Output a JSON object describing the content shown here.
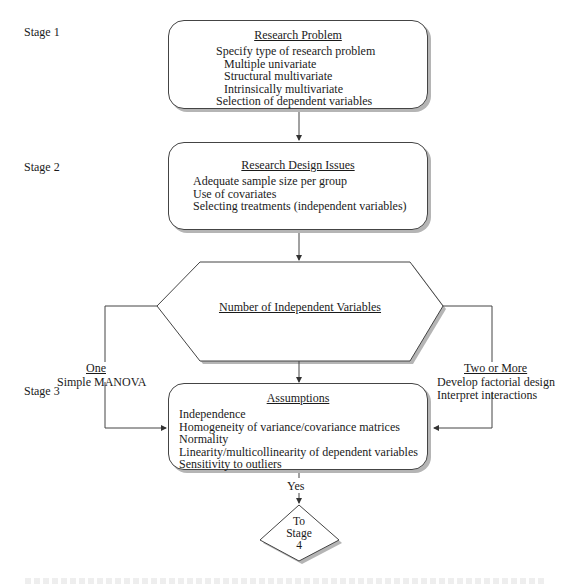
{
  "stages": [
    {
      "label": "Stage 1"
    },
    {
      "label": "Stage 2"
    },
    {
      "label": "Stage 3"
    }
  ],
  "boxes": {
    "research_problem": {
      "title": "Research Problem",
      "items": [
        {
          "text": "Specify type of research problem",
          "indent": false
        },
        {
          "text": "Multiple univariate",
          "indent": true
        },
        {
          "text": "Structural multivariate",
          "indent": true
        },
        {
          "text": "Intrinsically multivariate",
          "indent": true
        },
        {
          "text": "Selection of dependent variables",
          "indent": false
        }
      ]
    },
    "research_design": {
      "title": "Research Design Issues",
      "items": [
        {
          "text": "Adequate sample size per group"
        },
        {
          "text": "Use of covariates"
        },
        {
          "text": "Selecting treatments (independent variables)"
        }
      ]
    },
    "decision": {
      "title": "Number of Independent Variables"
    },
    "assumptions": {
      "title": "Assumptions",
      "items": [
        {
          "text": "Independence"
        },
        {
          "text": "Homogeneity of variance/covariance matrices"
        },
        {
          "text": "Normality"
        },
        {
          "text": "Linearity/multicollinearity of dependent variables"
        },
        {
          "text": "Sensitivity to outliers"
        }
      ]
    }
  },
  "branches": {
    "left": {
      "label": "One",
      "detail": "Simple MANOVA"
    },
    "right": {
      "label": "Two or More",
      "details": [
        "Develop factorial design",
        "Interpret interactions"
      ]
    }
  },
  "exit": {
    "condition": "Yes",
    "target_lines": [
      "To",
      "Stage",
      "4"
    ]
  },
  "colors": {
    "line": "#444444",
    "shadow": "#b5b5b5",
    "background": "#ffffff"
  }
}
